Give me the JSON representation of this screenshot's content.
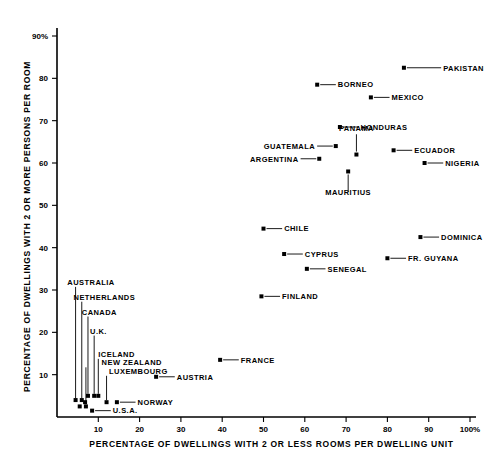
{
  "chart_data": {
    "type": "scatter",
    "title": "",
    "xlabel": "PERCENTAGE OF DWELLINGS WITH 2 OR LESS ROOMS PER DWELLING UNIT",
    "ylabel": "PERCENTAGE OF DWELLINGS WITH 2 OR MORE PERSONS PER ROOM",
    "xlim": [
      0,
      100
    ],
    "ylim": [
      0,
      93
    ],
    "grid": false,
    "legend": "none",
    "xticks": [
      10,
      20,
      30,
      40,
      50,
      60,
      70,
      80,
      90,
      100
    ],
    "xtick_labels": [
      "10",
      "20",
      "30",
      "40",
      "50",
      "60",
      "70",
      "80",
      "90",
      "100%"
    ],
    "yticks": [
      10,
      20,
      30,
      40,
      50,
      60,
      70,
      80,
      90
    ],
    "ytick_labels": [
      "10",
      "20",
      "30",
      "40",
      "50",
      "60",
      "70",
      "80",
      "90%"
    ],
    "points": [
      {
        "label": "PAKISTAN",
        "x": 84.0,
        "y": 82.5,
        "lx": 93.5,
        "ly": 82.5,
        "anchor": "start",
        "leader": "right"
      },
      {
        "label": "BORNEO",
        "x": 63.0,
        "y": 78.5,
        "lx": 68.0,
        "ly": 78.5,
        "anchor": "start",
        "leader": "right"
      },
      {
        "label": "MEXICO",
        "x": 76.0,
        "y": 75.5,
        "lx": 81.0,
        "ly": 75.5,
        "anchor": "start",
        "leader": "right"
      },
      {
        "label": "HONDURAS",
        "x": 68.5,
        "y": 68.5,
        "lx": 73.5,
        "ly": 68.5,
        "anchor": "start",
        "leader": "right"
      },
      {
        "label": "GUATEMALA",
        "x": 67.5,
        "y": 64.0,
        "lx": 62.5,
        "ly": 64.0,
        "anchor": "end",
        "leader": "left"
      },
      {
        "label": "PANAMA",
        "x": 72.5,
        "y": 62.0,
        "lx": 72.5,
        "ly": 67.5,
        "anchor": "middle",
        "leader": "up"
      },
      {
        "label": "ECUADOR",
        "x": 81.5,
        "y": 63.0,
        "lx": 86.5,
        "ly": 63.0,
        "anchor": "start",
        "leader": "right"
      },
      {
        "label": "ARGENTINA",
        "x": 63.5,
        "y": 61.0,
        "lx": 58.5,
        "ly": 61.0,
        "anchor": "end",
        "leader": "left"
      },
      {
        "label": "NIGERIA",
        "x": 89.0,
        "y": 60.0,
        "lx": 94.0,
        "ly": 60.0,
        "anchor": "start",
        "leader": "right"
      },
      {
        "label": "MAURITIUS",
        "x": 70.5,
        "y": 58.0,
        "lx": 70.5,
        "ly": 52.5,
        "anchor": "middle",
        "leader": "down"
      },
      {
        "label": "CHILE",
        "x": 50.0,
        "y": 44.5,
        "lx": 55.0,
        "ly": 44.5,
        "anchor": "start",
        "leader": "right"
      },
      {
        "label": "DOMINICA",
        "x": 88.0,
        "y": 42.5,
        "lx": 93.0,
        "ly": 42.5,
        "anchor": "start",
        "leader": "right"
      },
      {
        "label": "CYPRUS",
        "x": 55.0,
        "y": 38.5,
        "lx": 60.0,
        "ly": 38.5,
        "anchor": "start",
        "leader": "right"
      },
      {
        "label": "FR. GUYANA",
        "x": 80.0,
        "y": 37.5,
        "lx": 85.0,
        "ly": 37.5,
        "anchor": "start",
        "leader": "right"
      },
      {
        "label": "SENEGAL",
        "x": 60.5,
        "y": 35.0,
        "lx": 65.5,
        "ly": 35.0,
        "anchor": "start",
        "leader": "right"
      },
      {
        "label": "FINLAND",
        "x": 49.5,
        "y": 28.5,
        "lx": 54.5,
        "ly": 28.5,
        "anchor": "start",
        "leader": "right"
      },
      {
        "label": "AUSTRALIA",
        "x": 4.5,
        "y": 4.0,
        "lx": 2.5,
        "ly": 30.5,
        "anchor": "start",
        "leader": "vert"
      },
      {
        "label": "NETHERLANDS",
        "x": 6.0,
        "y": 4.0,
        "lx": 4.0,
        "ly": 27.0,
        "anchor": "start",
        "leader": "vert"
      },
      {
        "label": "CANADA",
        "x": 7.5,
        "y": 5.0,
        "lx": 6.0,
        "ly": 23.5,
        "anchor": "start",
        "leader": "vert"
      },
      {
        "label": "U.K.",
        "x": 9.0,
        "y": 5.0,
        "lx": 8.0,
        "ly": 19.0,
        "anchor": "start",
        "leader": "vert"
      },
      {
        "label": "ICELAND",
        "x": 10.0,
        "y": 5.0,
        "lx": 10.0,
        "ly": 13.5,
        "anchor": "start",
        "leader": "vert"
      },
      {
        "label": "NEW ZEALAND",
        "x": 7.0,
        "y": 2.5,
        "lx": 10.8,
        "ly": 11.5,
        "anchor": "start",
        "leader": "vert"
      },
      {
        "label": "LUXEMBOURG",
        "x": 12.0,
        "y": 3.5,
        "lx": 12.6,
        "ly": 9.5,
        "anchor": "start",
        "leader": "vert"
      },
      {
        "label": "AUSTRIA",
        "x": 24.0,
        "y": 9.5,
        "lx": 29.0,
        "ly": 9.5,
        "anchor": "start",
        "leader": "right"
      },
      {
        "label": "FRANCE",
        "x": 39.5,
        "y": 13.5,
        "lx": 44.5,
        "ly": 13.5,
        "anchor": "start",
        "leader": "right"
      },
      {
        "label": "NORWAY",
        "x": 14.5,
        "y": 3.5,
        "lx": 19.5,
        "ly": 3.5,
        "anchor": "start",
        "leader": "right"
      },
      {
        "label": "U.S.A.",
        "x": 8.5,
        "y": 1.5,
        "lx": 13.5,
        "ly": 1.5,
        "anchor": "start",
        "leader": "right"
      },
      {
        "label": "",
        "x": 5.5,
        "y": 2.5,
        "lx": 5.5,
        "ly": 2.5,
        "anchor": "start",
        "leader": "none"
      },
      {
        "label": "",
        "x": 6.8,
        "y": 3.5,
        "lx": 6.8,
        "ly": 3.5,
        "anchor": "start",
        "leader": "none"
      }
    ]
  },
  "axes": {
    "x_title": "PERCENTAGE OF DWELLINGS WITH 2 OR LESS ROOMS PER DWELLING UNIT",
    "y_title": "PERCENTAGE OF DWELLINGS WITH 2 OR MORE PERSONS PER ROOM"
  },
  "colors": {
    "background": "#ffffff",
    "ink": "#000000",
    "marker": "#000000"
  }
}
